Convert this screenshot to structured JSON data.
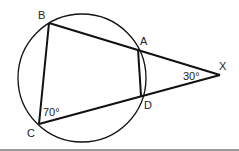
{
  "diagram": {
    "type": "circle-secant-geometry",
    "circle": {
      "cx": 82,
      "cy": 78,
      "r": 64
    },
    "points": {
      "B": {
        "x": 49,
        "y": 23,
        "label": "B"
      },
      "A": {
        "x": 138,
        "y": 49,
        "label": "A"
      },
      "X": {
        "x": 220,
        "y": 75,
        "label": "X"
      },
      "D": {
        "x": 141,
        "y": 96,
        "label": "D"
      },
      "C": {
        "x": 39,
        "y": 124,
        "label": "C"
      }
    },
    "angles": {
      "C": "70°",
      "X": "30°"
    },
    "colors": {
      "stroke": "#111111",
      "rule": "#9a9a9a"
    }
  }
}
